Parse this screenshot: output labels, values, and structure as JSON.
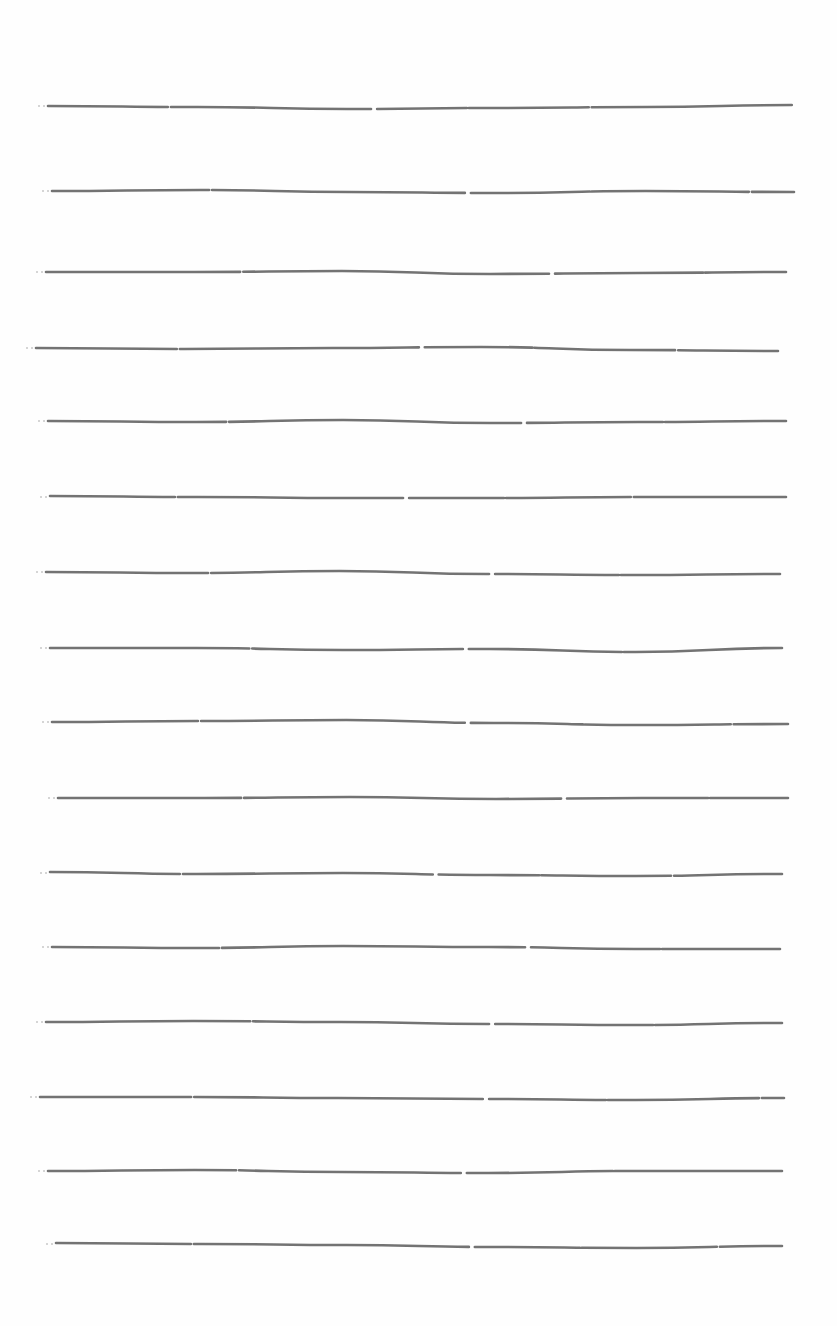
{
  "page": {
    "type": "ruled-paper",
    "background": "#fefefe",
    "ink_color": "#5a5a5a",
    "line_count": 16
  },
  "lines": [
    {
      "y": 106,
      "x1": 48,
      "x2": 796,
      "wave": [
        0,
        1,
        3,
        2,
        1,
        -1
      ]
    },
    {
      "y": 191,
      "x1": 52,
      "x2": 794,
      "wave": [
        0,
        -1,
        1,
        2,
        0,
        1
      ]
    },
    {
      "y": 272,
      "x1": 46,
      "x2": 786,
      "wave": [
        0,
        0,
        -1,
        2,
        1,
        0
      ]
    },
    {
      "y": 348,
      "x1": 36,
      "x2": 778,
      "wave": [
        0,
        1,
        0,
        -1,
        2,
        3
      ]
    },
    {
      "y": 421,
      "x1": 48,
      "x2": 786,
      "wave": [
        0,
        1,
        -1,
        2,
        1,
        0
      ]
    },
    {
      "y": 497,
      "x1": 50,
      "x2": 786,
      "wave": [
        -1,
        0,
        1,
        1,
        0,
        0
      ]
    },
    {
      "y": 572,
      "x1": 46,
      "x2": 780,
      "wave": [
        0,
        1,
        -1,
        2,
        3,
        2
      ]
    },
    {
      "y": 648,
      "x1": 50,
      "x2": 782,
      "wave": [
        0,
        0,
        2,
        1,
        4,
        0
      ]
    },
    {
      "y": 722,
      "x1": 52,
      "x2": 788,
      "wave": [
        0,
        -1,
        -2,
        1,
        3,
        2
      ]
    },
    {
      "y": 798,
      "x1": 58,
      "x2": 788,
      "wave": [
        0,
        0,
        -1,
        1,
        0,
        0
      ]
    },
    {
      "y": 873,
      "x1": 50,
      "x2": 782,
      "wave": [
        -1,
        1,
        0,
        2,
        3,
        1
      ]
    },
    {
      "y": 947,
      "x1": 52,
      "x2": 780,
      "wave": [
        0,
        1,
        -1,
        0,
        2,
        2
      ]
    },
    {
      "y": 1022,
      "x1": 46,
      "x2": 782,
      "wave": [
        0,
        -1,
        0,
        2,
        3,
        1
      ]
    },
    {
      "y": 1097,
      "x1": 40,
      "x2": 784,
      "wave": [
        0,
        0,
        1,
        2,
        3,
        1
      ]
    },
    {
      "y": 1171,
      "x1": 48,
      "x2": 782,
      "wave": [
        0,
        -1,
        1,
        2,
        0,
        0
      ]
    },
    {
      "y": 1244,
      "x1": 56,
      "x2": 782,
      "wave": [
        -1,
        0,
        1,
        3,
        4,
        2
      ]
    }
  ]
}
